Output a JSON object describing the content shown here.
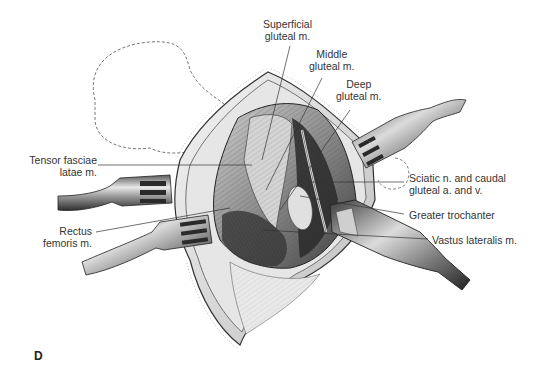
{
  "figure": {
    "panel_letter": "D",
    "labels": {
      "superficial_gluteal": [
        "Superficial",
        "gluteal m."
      ],
      "middle_gluteal": [
        "Middle",
        "gluteal m."
      ],
      "deep_gluteal": [
        "Deep",
        "gluteal m."
      ],
      "tensor_fasciae_latae": [
        "Tensor fasciae",
        "latae m."
      ],
      "rectus_femoris": [
        "Rectus",
        "femoris m."
      ],
      "sciatic_nerve": [
        "Sciatic n. and caudal",
        "gluteal a. and v."
      ],
      "greater_trochanter": [
        "Greater trochanter"
      ],
      "vastus_lateralis": [
        "Vastus lateralis m."
      ]
    }
  }
}
